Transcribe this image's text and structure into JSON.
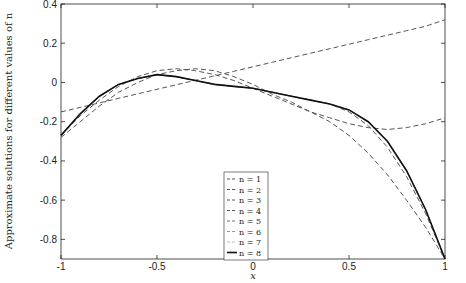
{
  "chart_data": {
    "type": "line",
    "title": "",
    "xlabel": "x",
    "ylabel": "Approximate solutions for different values of n",
    "xlim": [
      -1,
      1
    ],
    "ylim": [
      -0.9,
      0.4
    ],
    "xticks": [
      -1,
      -0.5,
      0,
      0.5,
      1
    ],
    "xtick_labels": [
      "-1",
      "-0.5",
      "0",
      "0.5",
      "1"
    ],
    "yticks": [
      0.4,
      0.2,
      0,
      -0.2,
      -0.4,
      -0.6,
      -0.8
    ],
    "ytick_labels": [
      "0.4",
      "0.2",
      "0",
      "-0.2",
      "-0.4",
      "-0.6",
      "-0.8"
    ],
    "grid": false,
    "legend_position": "center-right",
    "x": [
      -1,
      -0.9,
      -0.8,
      -0.7,
      -0.6,
      -0.5,
      -0.4,
      -0.3,
      -0.2,
      -0.1,
      0,
      0.1,
      0.2,
      0.3,
      0.4,
      0.5,
      0.6,
      0.7,
      0.8,
      0.9,
      1
    ],
    "series": [
      {
        "name": "n = 1",
        "style": "dashed",
        "color": "#555555",
        "values": [
          -0.15,
          -0.127,
          -0.104,
          -0.081,
          -0.058,
          -0.035,
          -0.012,
          0.011,
          0.034,
          0.057,
          0.08,
          0.103,
          0.126,
          0.149,
          0.172,
          0.195,
          0.218,
          0.241,
          0.264,
          0.287,
          0.32
        ]
      },
      {
        "name": "n = 2",
        "style": "dashed",
        "color": "#555555",
        "values": [
          -0.28,
          -0.2,
          -0.12,
          -0.05,
          0.0,
          0.04,
          0.06,
          0.07,
          0.06,
          0.03,
          -0.01,
          -0.06,
          -0.1,
          -0.15,
          -0.2,
          -0.27,
          -0.36,
          -0.47,
          -0.6,
          -0.74,
          -0.9
        ]
      },
      {
        "name": "n = 3",
        "style": "dashed",
        "color": "#555555",
        "values": [
          -0.27,
          -0.17,
          -0.09,
          -0.02,
          0.03,
          0.06,
          0.07,
          0.06,
          0.04,
          0.01,
          -0.03,
          -0.07,
          -0.11,
          -0.15,
          -0.18,
          -0.21,
          -0.23,
          -0.24,
          -0.23,
          -0.21,
          -0.18
        ]
      },
      {
        "name": "n = 4",
        "style": "dashed",
        "color": "#555555",
        "values": [
          -0.27,
          -0.16,
          -0.07,
          -0.01,
          0.02,
          0.04,
          0.03,
          0.01,
          -0.01,
          -0.02,
          -0.03,
          -0.05,
          -0.07,
          -0.09,
          -0.11,
          -0.15,
          -0.22,
          -0.33,
          -0.48,
          -0.67,
          -0.9
        ]
      },
      {
        "name": "n = 5",
        "style": "dashed",
        "color": "#777777",
        "values": [
          -0.27,
          -0.16,
          -0.07,
          -0.01,
          0.02,
          0.04,
          0.03,
          0.01,
          -0.01,
          -0.02,
          -0.03,
          -0.05,
          -0.07,
          -0.09,
          -0.11,
          -0.14,
          -0.2,
          -0.3,
          -0.45,
          -0.65,
          -0.9
        ]
      },
      {
        "name": "n = 6",
        "style": "dashed",
        "color": "#999999",
        "values": [
          -0.27,
          -0.16,
          -0.07,
          -0.01,
          0.02,
          0.04,
          0.03,
          0.01,
          -0.01,
          -0.02,
          -0.03,
          -0.05,
          -0.07,
          -0.09,
          -0.11,
          -0.14,
          -0.2,
          -0.3,
          -0.45,
          -0.65,
          -0.9
        ]
      },
      {
        "name": "n = 7",
        "style": "dashed",
        "color": "#bbbbbb",
        "values": [
          -0.27,
          -0.16,
          -0.07,
          -0.01,
          0.02,
          0.04,
          0.03,
          0.01,
          -0.01,
          -0.02,
          -0.03,
          -0.05,
          -0.07,
          -0.09,
          -0.11,
          -0.14,
          -0.2,
          -0.3,
          -0.45,
          -0.65,
          -0.9
        ]
      },
      {
        "name": "n = 8",
        "style": "solid",
        "color": "#111111",
        "values": [
          -0.27,
          -0.16,
          -0.07,
          -0.01,
          0.02,
          0.04,
          0.03,
          0.01,
          -0.01,
          -0.02,
          -0.03,
          -0.05,
          -0.07,
          -0.09,
          -0.11,
          -0.14,
          -0.2,
          -0.3,
          -0.45,
          -0.65,
          -0.9
        ]
      }
    ]
  }
}
